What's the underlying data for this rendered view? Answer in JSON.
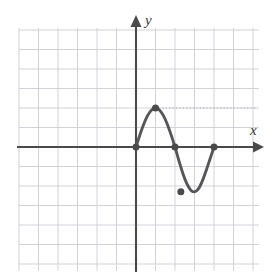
{
  "figure": {
    "name": "sine-wave-graph",
    "background_color": "#ffffff",
    "axis_color": "#4a4a4a",
    "grid_color": "#c9ccd4",
    "curve_color": "#55555a",
    "point_color": "#4a4a4a"
  },
  "labels": {
    "x_axis": "x",
    "y_axis": "y"
  },
  "chart_data": {
    "type": "line",
    "title": "",
    "xlabel": "x",
    "ylabel": "y",
    "grid": true,
    "legend": "none",
    "xlim": [
      -6,
      6.3
    ],
    "ylim": [
      -6.3,
      6.1
    ],
    "x_tick_step": 1,
    "y_tick_step": 1,
    "tick_labels_shown": false,
    "series": [
      {
        "name": "curve",
        "description": "sine-like wave with one full period between x=0 and x=4",
        "comment": "amplitude about 2 units, zeros at x=0, 2, 4; maximum near x=1, minimum near x=2.3",
        "x": [
          0,
          0.2,
          0.4,
          0.6,
          0.8,
          1.0,
          1.2,
          1.4,
          1.6,
          1.8,
          2.0,
          2.2,
          2.4,
          2.6,
          2.8,
          3.0,
          3.2,
          3.4,
          3.6,
          3.8,
          4.0
        ],
        "y": [
          0,
          0.62,
          1.18,
          1.62,
          1.9,
          2.0,
          1.9,
          1.62,
          1.18,
          0.62,
          0,
          -0.7,
          -1.35,
          -1.87,
          -2.2,
          -2.3,
          -2.15,
          -1.75,
          -1.2,
          -0.6,
          0
        ]
      }
    ],
    "marked_points": [
      {
        "label": "origin-zero",
        "x": 0,
        "y": 0
      },
      {
        "label": "maximum",
        "x": 1,
        "y": 2
      },
      {
        "label": "middle-zero",
        "x": 2,
        "y": 0
      },
      {
        "label": "minimum",
        "x": 2.3,
        "y": -2.3
      },
      {
        "label": "right-zero",
        "x": 4,
        "y": 0
      }
    ],
    "annotations": [
      {
        "type": "dotted-guide",
        "from_x": 1,
        "to_x": 6.3,
        "y": 2,
        "description": "faint dotted horizontal guide at the maximum level"
      }
    ]
  }
}
